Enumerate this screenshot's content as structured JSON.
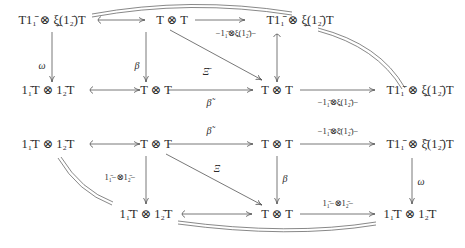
{
  "diagram": {
    "type": "commutative-diagram",
    "nodes": {
      "r1c1": "T1₁̄ ⊗ ξ̲(1₂̄)T",
      "r1c2": "T ⊗ T",
      "r1c3": "T1₁̄ ⊗ ξ̲(1₂̄)T",
      "r2c1": "1₁̄T ⊗ 1₂̄T",
      "r2c2": "T ⊗ T",
      "r2c3": "T ⊗ T",
      "r2c4": "T1₁̄ ⊗ ξ̲(1₂̄)T",
      "r3c1": "1₁̄T ⊗ 1₂̄T",
      "r3c2": "T ⊗ T",
      "r3c3": "T ⊗ T",
      "r3c4": "T1₁̄ ⊗ ξ̄(1₂̄)T",
      "r4c2": "1₁̄T ⊗ 1₂̄T",
      "r4c3": "T ⊗ T",
      "r4c4": "1₁̄T ⊗ 1₂̄T"
    },
    "labels": {
      "omega_top": "ω",
      "beta_top": "β",
      "xi_bar_top": "Ξ̄",
      "top_right_arrow": "−1₁̄⊗ξ̲(1₂̄)−",
      "beta_tilde_1": "β̃",
      "beta_tilde_2": "β̃",
      "mid_right_1": "−1₁̄⊗ξ̲(1₂̄)−",
      "mid_right_2": "−1₁̄⊗ξ̄(1₂̄)−",
      "xi_bottom": "Ξ",
      "one_tensor_left": "1₁̄−⊗1₂̄−",
      "beta_bottom": "β",
      "omega_bottom": "ω",
      "one_tensor_right": "1₁̄−⊗1₂̄−"
    }
  }
}
